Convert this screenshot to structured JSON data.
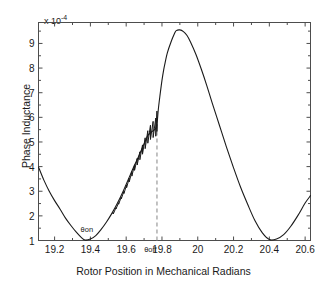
{
  "figure": {
    "y_multiplier_prefix": "x 10",
    "y_multiplier_exponent": "-4",
    "ylabel": "Phase Inductance",
    "xlabel": "Rotor Position in Mechanical Radians",
    "line_color": "#1a1a1a",
    "axis_color": "#4d4d4d",
    "marker_line_color": "#9a9a9a",
    "background": "#ffffff"
  },
  "yticks": [
    {
      "label": "1",
      "value": 1
    },
    {
      "label": "2",
      "value": 2
    },
    {
      "label": "3",
      "value": 3
    },
    {
      "label": "4",
      "value": 4
    },
    {
      "label": "5",
      "value": 5
    },
    {
      "label": "6",
      "value": 6
    },
    {
      "label": "7",
      "value": 7
    },
    {
      "label": "8",
      "value": 8
    },
    {
      "label": "9",
      "value": 9
    }
  ],
  "xticks": [
    {
      "label": "19.2",
      "value": 19.2
    },
    {
      "label": "19.4",
      "value": 19.4
    },
    {
      "label": "19.6",
      "value": 19.6
    },
    {
      "label": "19.8",
      "value": 19.8
    },
    {
      "label": "20",
      "value": 20.0
    },
    {
      "label": "20.2",
      "value": 20.2
    },
    {
      "label": "20.4",
      "value": 20.4
    },
    {
      "label": "20.6",
      "value": 20.6
    }
  ],
  "annotations": [
    {
      "name": "theta-on",
      "text": "θon",
      "x": 19.38,
      "y": 1.42
    },
    {
      "name": "theta-off",
      "text": "θoff",
      "x": 19.735,
      "y": 0.62
    }
  ],
  "chart_data": {
    "type": "line",
    "title": "",
    "xlabel": "Rotor Position in Mechanical Radians",
    "ylabel": "Phase Inductance",
    "y_scale_multiplier": "1e-4",
    "xlim": [
      19.11,
      20.63
    ],
    "ylim": [
      1.0,
      9.85
    ],
    "grid": false,
    "legend": null,
    "marker_lines": [
      {
        "name": "theta-off-dashed",
        "orientation": "vertical",
        "x": 19.772,
        "y_from": 1.0,
        "y_to": 5.72,
        "style": "dashed",
        "color": "#9a9a9a"
      }
    ],
    "series": [
      {
        "name": "Phase inductance profile",
        "color": "#1a1a1a",
        "x": [
          19.11,
          19.14,
          19.17,
          19.2,
          19.23,
          19.26,
          19.29,
          19.32,
          19.35,
          19.37,
          19.4,
          19.43,
          19.46,
          19.49,
          19.52,
          19.55,
          19.58,
          19.61,
          19.64,
          19.67,
          19.7,
          19.72,
          19.74,
          19.755,
          19.765,
          19.772,
          19.78,
          19.79,
          19.8,
          19.81,
          19.82,
          19.83,
          19.85,
          19.87,
          19.88,
          19.9,
          19.92,
          19.94,
          19.96,
          19.99,
          20.02,
          20.05,
          20.08,
          20.12,
          20.16,
          20.2,
          20.24,
          20.28,
          20.32,
          20.36,
          20.4,
          20.44,
          20.48,
          20.52,
          20.56,
          20.6,
          20.63
        ],
        "y": [
          3.98,
          3.45,
          3.0,
          2.62,
          2.28,
          1.92,
          1.62,
          1.35,
          1.12,
          1.02,
          1.06,
          1.2,
          1.45,
          1.75,
          2.1,
          2.5,
          2.95,
          3.45,
          3.95,
          4.42,
          4.92,
          5.25,
          5.4,
          5.48,
          5.55,
          5.72,
          6.35,
          6.95,
          7.5,
          7.95,
          8.3,
          8.62,
          9.05,
          9.4,
          9.52,
          9.55,
          9.48,
          9.32,
          9.05,
          8.55,
          7.95,
          7.3,
          6.6,
          5.7,
          4.8,
          3.95,
          3.15,
          2.45,
          1.8,
          1.32,
          1.04,
          1.06,
          1.24,
          1.58,
          2.02,
          2.52,
          2.82
        ],
        "ripple_region": {
          "x_from": 19.52,
          "x_to": 19.772,
          "description": "small stepped ripple superimposed on rising edge, amplitude grows toward theta-off"
        }
      }
    ]
  }
}
